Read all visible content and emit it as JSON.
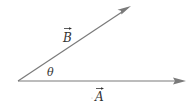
{
  "diagram": {
    "type": "vector-angle",
    "colors": {
      "line": "#7a7a7a",
      "text": "#333333",
      "background": "#ffffff"
    },
    "origin": {
      "x": 18,
      "y": 81
    },
    "vectors": [
      {
        "name": "A",
        "label": "A",
        "has_arrow_over_label": true,
        "tip": {
          "x": 186,
          "y": 81
        }
      },
      {
        "name": "B",
        "label": "B",
        "has_arrow_over_label": true,
        "tip": {
          "x": 131,
          "y": 6
        }
      }
    ],
    "angle_label": "θ"
  }
}
